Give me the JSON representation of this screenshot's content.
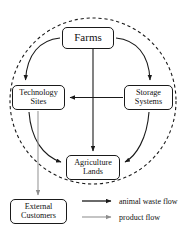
{
  "diagram": {
    "type": "circular-flow-diagram",
    "nodes": [
      {
        "id": "farms",
        "label": "Farms",
        "position": "top-center"
      },
      {
        "id": "technology_sites",
        "label": "Technology\nSites",
        "line1": "Technology",
        "line2": "Sites",
        "position": "left"
      },
      {
        "id": "storage_systems",
        "label": "Storage\nSystems",
        "line1": "Storage",
        "line2": "Systems",
        "position": "right"
      },
      {
        "id": "agriculture_lands",
        "label": "Agriculture\nLands",
        "line1": "Agriculture",
        "line2": "Lands",
        "position": "bottom-center"
      },
      {
        "id": "external_customers",
        "label": "External\nCustomers",
        "line1": "External",
        "line2": "Customers",
        "position": "outside-bottom-left"
      }
    ],
    "edges": [
      {
        "from": "farms",
        "to": "technology_sites",
        "style": "curved",
        "flow": "animal waste flow"
      },
      {
        "from": "farms",
        "to": "storage_systems",
        "style": "curved",
        "flow": "animal waste flow"
      },
      {
        "from": "farms",
        "to": "agriculture_lands",
        "style": "straight-vertical",
        "flow": "animal waste flow"
      },
      {
        "from": "technology_sites",
        "to": "agriculture_lands",
        "style": "curved",
        "flow": "animal waste flow"
      },
      {
        "from": "storage_systems",
        "to": "agriculture_lands",
        "style": "curved",
        "flow": "animal waste flow"
      },
      {
        "from": "storage_systems",
        "to": "technology_sites",
        "style": "straight-horizontal",
        "flow": "animal waste flow"
      },
      {
        "from": "technology_sites",
        "to": "external_customers",
        "style": "straight-vertical",
        "flow": "product flow"
      }
    ],
    "boundary": {
      "outer": {
        "shape": "circle",
        "stroke": "dashed"
      },
      "inner": {
        "shape": "circle",
        "stroke": "solid"
      }
    }
  },
  "legend": {
    "items": [
      {
        "id": "animal-waste-flow",
        "label": "animal waste flow",
        "color": "#1a1a1a",
        "marker": "arrow"
      },
      {
        "id": "product-flow",
        "label": "product flow",
        "color": "#9a9a9a",
        "marker": "arrow"
      }
    ]
  },
  "colors": {
    "stroke_dark": "#1a1a1a",
    "stroke_gray": "#9a9a9a",
    "box_fill": "#ffffff",
    "background": "#ffffff"
  }
}
